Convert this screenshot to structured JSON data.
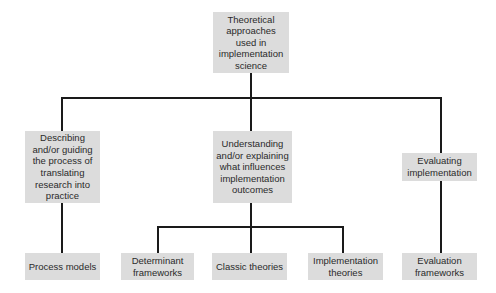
{
  "diagram": {
    "root": {
      "label": "Theoretical approaches used in implementation science"
    },
    "categories": [
      {
        "label": "Describing and/or guiding the process of translating research into practice"
      },
      {
        "label": "Understanding and/or explaining what influences implementation outcomes"
      },
      {
        "label": "Evaluating implementation"
      }
    ],
    "leaves": [
      {
        "label": "Process models",
        "parent": 0
      },
      {
        "label": "Determinant frameworks",
        "parent": 1
      },
      {
        "label": "Classic theories",
        "parent": 1
      },
      {
        "label": "Implementation theories",
        "parent": 1
      },
      {
        "label": "Evaluation frameworks",
        "parent": 2
      }
    ],
    "colors": {
      "box_fill": "#dcdcdc",
      "connector": "#1a1a1a",
      "text": "#2a2a2a"
    }
  }
}
